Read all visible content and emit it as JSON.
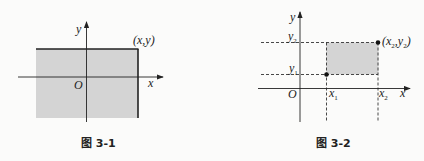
{
  "figure1": {
    "caption": "图 3-1",
    "axis_x_label": "x",
    "axis_y_label": "y",
    "origin_label": "O",
    "point_label": "(x,y)",
    "fill_color": "#d4d4d4",
    "description": "Shaded region x ≤ a, y ≤ b (lower-left quadrant region bounded by point (x,y))"
  },
  "figure2": {
    "caption": "图 3-2",
    "axis_x_label": "x",
    "axis_y_label": "y",
    "origin_label": "O",
    "x1_label": "x",
    "x1_sub": "1",
    "x2_label": "x",
    "x2_sub": "2",
    "y1_label": "y",
    "y1_sub": "1",
    "y2_label": "y",
    "y2_sub": "2",
    "point_label_prefix": "(x",
    "point_label_sub1": "2",
    "point_label_mid": ",y",
    "point_label_sub2": "2",
    "point_label_suffix": ")",
    "fill_color": "#d4d4d4",
    "description": "Shaded rectangle x1 < x ≤ x2, y1 < y ≤ y2"
  }
}
